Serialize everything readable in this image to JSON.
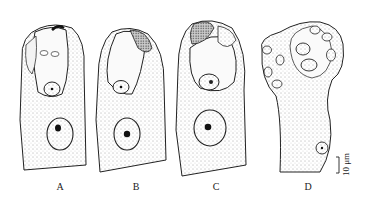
{
  "figure": {
    "panels": [
      {
        "id": "A",
        "label": "A",
        "label_x": 60
      },
      {
        "id": "B",
        "label": "B",
        "label_x": 136
      },
      {
        "id": "C",
        "label": "C",
        "label_x": 216
      },
      {
        "id": "D",
        "label": "D",
        "label_x": 308
      }
    ],
    "scale_bar": {
      "label": "10 μm"
    },
    "colors": {
      "ink": "#1a1a1a",
      "stipple": "#6a6a6a",
      "background": "#ffffff"
    }
  }
}
